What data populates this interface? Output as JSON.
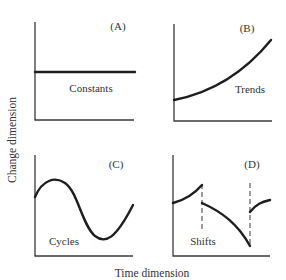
{
  "figure": {
    "y_axis_label": "Change dimension",
    "x_axis_label": "Time dimension",
    "panels": [
      {
        "id": "A",
        "tag": "(A)",
        "label": "Constants",
        "pattern": "flat horizontal line"
      },
      {
        "id": "B",
        "tag": "(B)",
        "label": "Trends",
        "pattern": "monotonically increasing curve"
      },
      {
        "id": "C",
        "tag": "(C)",
        "label": "Cycles",
        "pattern": "sinusoidal oscillation"
      },
      {
        "id": "D",
        "tag": "(D)",
        "label": "Shifts",
        "pattern": "discontinuous segments separated by dashed vertical lines"
      }
    ],
    "colors": {
      "line": "#1e1e1e",
      "axis": "#3a3a3a",
      "text": "#333333",
      "background": "#ffffff"
    }
  }
}
